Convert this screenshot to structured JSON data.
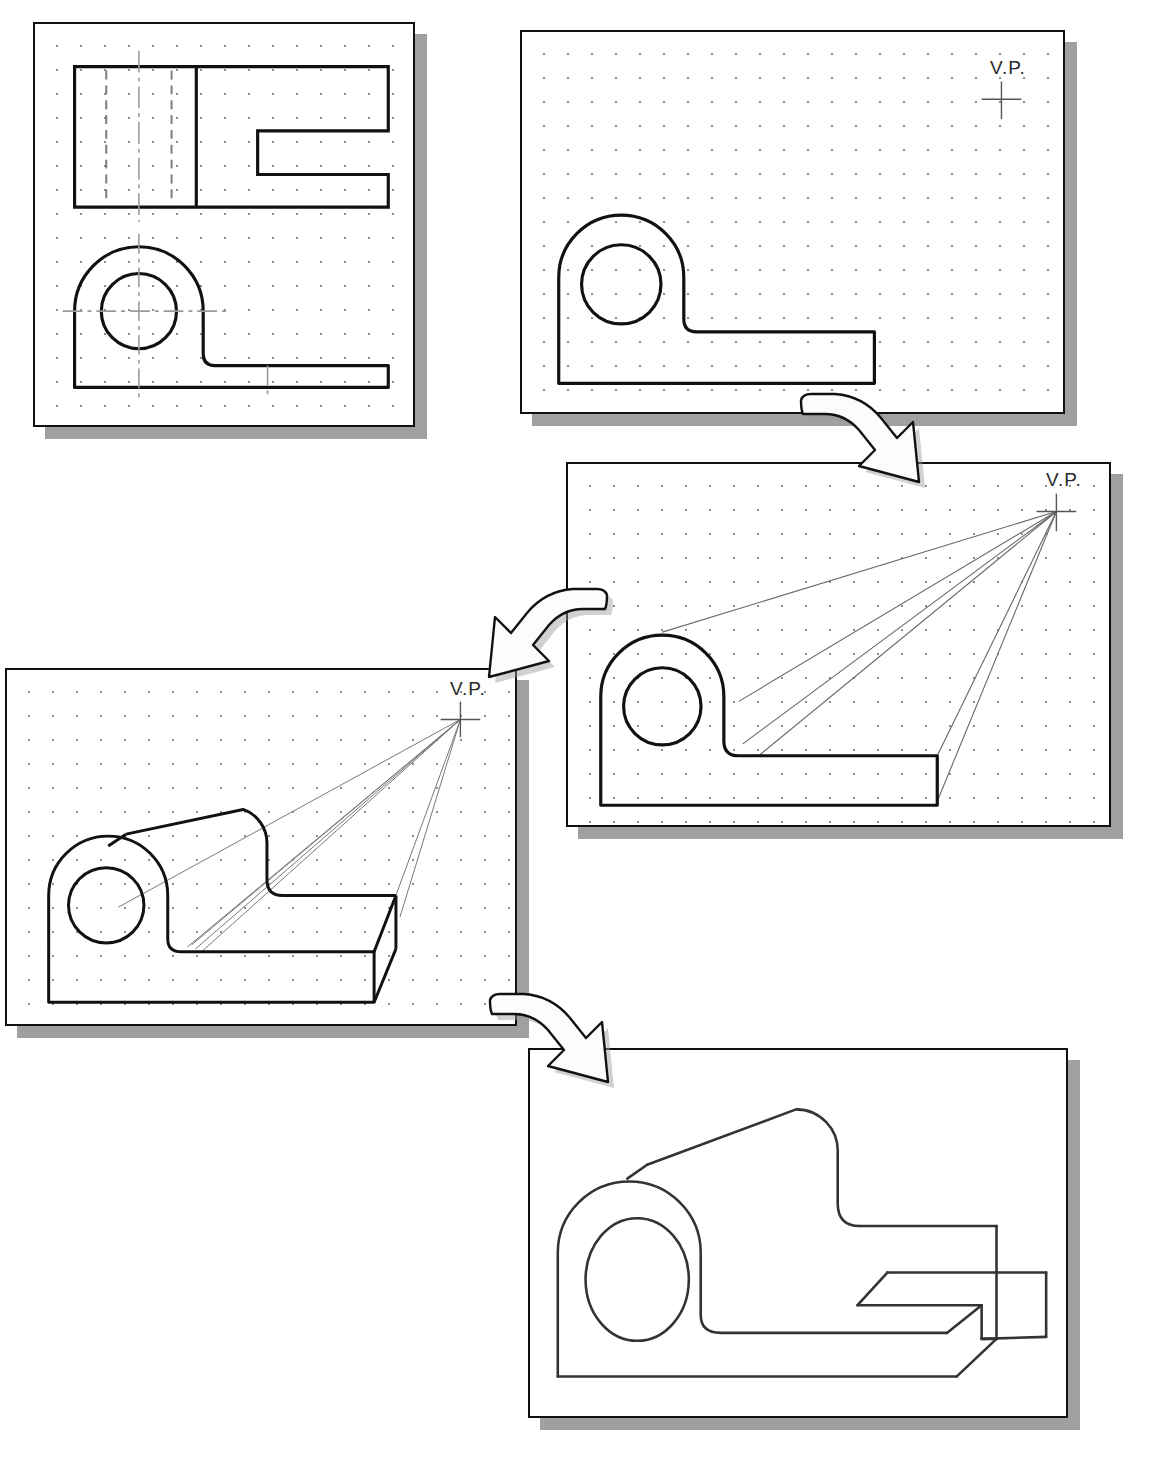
{
  "document": {
    "type": "technical-drawing-tutorial",
    "subject": "One-point perspective construction of a bearing bracket",
    "background_color": "#ffffff",
    "line_color": "#111111",
    "shadow_color": "#9a9a9a",
    "grid_dot_color": "#8d8d8d",
    "construction_line_color": "#555555"
  },
  "panels": [
    {
      "id": "panel-1",
      "step": 1,
      "name": "orthographic-views",
      "x": 33,
      "y": 22,
      "width": 382,
      "height": 405,
      "has_grid": true,
      "has_vp": false,
      "vp_label": "",
      "description": "Top view with hidden lines and front view with circular hole and centerlines"
    },
    {
      "id": "panel-2",
      "step": 2,
      "name": "front-profile-outline",
      "x": 520,
      "y": 30,
      "width": 545,
      "height": 384,
      "has_grid": true,
      "has_vp": true,
      "vp_label": "V.P.",
      "vp_x": 482,
      "vp_y": 68,
      "description": "Front profile of bracket drawn with vanishing point placed upper right"
    },
    {
      "id": "panel-3",
      "step": 3,
      "name": "projection-lines-to-vp",
      "x": 566,
      "y": 462,
      "width": 545,
      "height": 365,
      "has_grid": true,
      "has_vp": true,
      "vp_label": "V.P.",
      "vp_x": 492,
      "vp_y": 48,
      "description": "Projection lines drawn from profile corners back to the vanishing point"
    },
    {
      "id": "panel-4",
      "step": 4,
      "name": "depth-established",
      "x": 5,
      "y": 668,
      "width": 512,
      "height": 358,
      "has_grid": true,
      "has_vp": true,
      "vp_label": "V.P.",
      "vp_x": 457,
      "vp_y": 50,
      "description": "Depth cut off along projectors forming the receding solid with rounded top"
    },
    {
      "id": "panel-5",
      "step": 5,
      "name": "completed-perspective",
      "x": 528,
      "y": 1048,
      "width": 540,
      "height": 370,
      "has_grid": false,
      "has_vp": false,
      "vp_label": "",
      "description": "Finished one-point perspective pictorial with construction lines removed"
    }
  ],
  "arrows": [
    {
      "id": "arrow-1",
      "name": "arrow-panel2-to-panel3",
      "x": 795,
      "y": 388,
      "width": 155,
      "height": 105,
      "direction": "curve-right-down"
    },
    {
      "id": "arrow-2",
      "name": "arrow-panel3-to-panel4",
      "x": 458,
      "y": 583,
      "width": 155,
      "height": 105,
      "direction": "curve-left-down"
    },
    {
      "id": "arrow-3",
      "name": "arrow-panel4-to-panel5",
      "x": 484,
      "y": 988,
      "width": 155,
      "height": 105,
      "direction": "curve-right-down"
    }
  ],
  "labels": {
    "vanishing_point": "V.P."
  }
}
